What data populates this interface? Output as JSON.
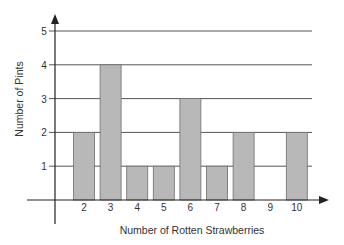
{
  "chart_data": {
    "type": "bar",
    "title": "",
    "xlabel": "Number of Rotten Strawberries",
    "ylabel": "Number of Pints",
    "categories": [
      "2",
      "3",
      "4",
      "5",
      "6",
      "7",
      "8",
      "9",
      "10"
    ],
    "values": [
      2,
      4,
      1,
      1,
      3,
      1,
      2,
      0,
      2
    ],
    "ylim": [
      0,
      5
    ],
    "yticks": [
      1,
      2,
      3,
      4,
      5
    ],
    "grid": true,
    "legend": null
  },
  "style": {
    "bar_fill": "#b8b8b8",
    "bar_stroke": "#6e6e6e",
    "axis_color": "#222222",
    "grid_color": "#555555"
  }
}
